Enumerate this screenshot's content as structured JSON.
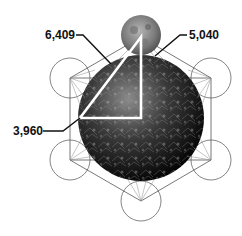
{
  "diagram": {
    "labels": {
      "top_left": "6,409",
      "top_right": "5,040",
      "left": "3,960"
    },
    "elements": {
      "moon": "moon",
      "earth": "earth",
      "triangle": "right-triangle",
      "outer_circles": 6
    },
    "colors": {
      "lines": "#555555",
      "triangle": "#ffffff",
      "text": "#111111"
    }
  }
}
